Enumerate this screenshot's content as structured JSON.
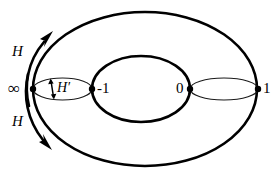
{
  "figure": {
    "background_color": "#ffffff",
    "stroke_color": "#000000",
    "labels": {
      "h_top": "H",
      "h_bottom": "H",
      "h_prime": "H′",
      "infinity": "∞",
      "minus_one": "-1",
      "zero": "0",
      "one": "1"
    },
    "marked_points": [
      {
        "name": "infinity",
        "label": "∞",
        "x": 33,
        "y": 89
      },
      {
        "name": "minus-one",
        "label": "-1",
        "x": 92,
        "y": 89
      },
      {
        "name": "zero",
        "label": "0",
        "x": 190,
        "y": 89
      },
      {
        "name": "one",
        "label": "1",
        "x": 258,
        "y": 89
      }
    ],
    "shapes": {
      "outer_ellipse": {
        "cx": 145,
        "cy": 89,
        "rx": 112,
        "ry": 77,
        "stroke_width": 2.6
      },
      "middle_ellipse": {
        "cx": 141,
        "cy": 89,
        "rx": 49,
        "ry": 33,
        "stroke_width": 2.6
      },
      "left_small_ellipse": {
        "cx": 62.5,
        "cy": 89,
        "rx": 29.5,
        "ry": 11,
        "stroke_width": 1.2
      },
      "right_small_ellipse": {
        "cx": 224,
        "cy": 89,
        "rx": 34,
        "ry": 11,
        "stroke_width": 1.2
      }
    },
    "arrows": {
      "h_top_arrow": {
        "direction": "up-right",
        "description": "curved arrow along left side of torus pointing upward"
      },
      "h_bottom_arrow": {
        "direction": "down-right",
        "description": "curved arrow along left side of torus pointing downward"
      },
      "h_prime_arrow": {
        "direction": "vertical-double",
        "description": "short double-headed vertical arrow inside left small ellipse"
      }
    }
  }
}
